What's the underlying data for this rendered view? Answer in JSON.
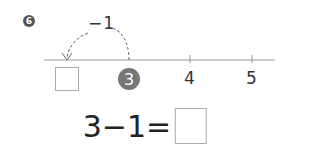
{
  "problem": {
    "number": "6",
    "operation_label": "−1",
    "number_line": {
      "ticks": [
        {
          "value": "",
          "x": 67,
          "kind": "answer-box"
        },
        {
          "value": "3",
          "x": 129,
          "kind": "highlighted"
        },
        {
          "value": "4",
          "x": 190,
          "kind": "plain"
        },
        {
          "value": "5",
          "x": 252,
          "kind": "plain"
        }
      ]
    },
    "equation": {
      "left": "3",
      "operator": "−",
      "right": "1",
      "equals": "=",
      "answer": ""
    }
  }
}
